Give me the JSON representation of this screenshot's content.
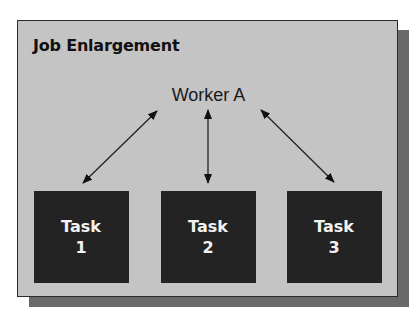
{
  "diagram": {
    "title": "Job Enlargement",
    "worker": {
      "label": "Worker A"
    },
    "tasks": [
      {
        "label": "Task",
        "number": "1"
      },
      {
        "label": "Task",
        "number": "2"
      },
      {
        "label": "Task",
        "number": "3"
      }
    ],
    "connections": [
      {
        "from": "Worker A",
        "to": "Task 1",
        "type": "bidirectional"
      },
      {
        "from": "Worker A",
        "to": "Task 2",
        "type": "bidirectional"
      },
      {
        "from": "Worker A",
        "to": "Task 3",
        "type": "bidirectional"
      }
    ],
    "colors": {
      "panel": "#c4c4c4",
      "task_box": "#232323",
      "shadow": "#6a6a6a",
      "text": "#111111"
    }
  }
}
